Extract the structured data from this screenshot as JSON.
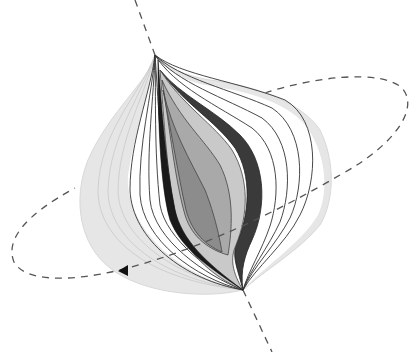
{
  "diagram": {
    "type": "nested-spindle-surfaces",
    "colors": {
      "background": "#ffffff",
      "outer_shell": "#e4e4e4",
      "outer_shell_edge": "#d6d6d6",
      "contour_line": "#333333",
      "white_layer": "#ffffff",
      "dark_band": "#3a3a3a",
      "mid_gray": "#a8a8a8",
      "light_gray": "#c8c8c8",
      "inner_dark": "#8a8a8a",
      "core_black": "#1a1a1a",
      "dashed_line": "#555555"
    },
    "axis": {
      "style": "dashed",
      "top": [
        135,
        0
      ],
      "upper_pole": [
        155,
        55
      ],
      "lower_pole": [
        243,
        290
      ],
      "bottom": [
        272,
        352
      ]
    },
    "orbit": {
      "style": "dashed",
      "shape": "ellipse",
      "arrow": "direction-arrowhead"
    },
    "caption": {
      "text": ""
    }
  }
}
